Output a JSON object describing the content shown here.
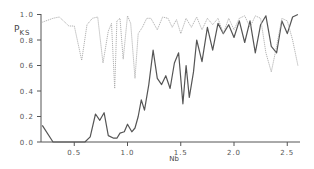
{
  "chart_data": {
    "type": "line",
    "title": "",
    "xlabel": "Nb",
    "ylabel": "P_KS",
    "ylabel_main": "P",
    "ylabel_sub": "KS",
    "xlim": [
      0.19,
      2.62
    ],
    "ylim": [
      0.0,
      1.0
    ],
    "grid": false,
    "legend": null,
    "x_ticks": [
      0.5,
      1.0,
      1.5,
      2.0,
      2.5
    ],
    "x_tick_labels": [
      "0.5",
      "1.0",
      "1.5",
      "2.0",
      "2.5"
    ],
    "y_ticks": [
      0.0,
      0.2,
      0.4,
      0.6,
      0.8,
      1.0
    ],
    "y_tick_labels": [
      "0.0",
      "0.2",
      "0.4",
      "0.6",
      "0.8",
      "1.0"
    ],
    "series": [
      {
        "name": "solid",
        "style": "solid",
        "color": "#555555",
        "x": [
          0.2,
          0.3,
          0.4,
          0.5,
          0.6,
          0.65,
          0.7,
          0.74,
          0.78,
          0.82,
          0.87,
          0.9,
          0.93,
          0.97,
          1.0,
          1.04,
          1.07,
          1.1,
          1.13,
          1.16,
          1.2,
          1.24,
          1.28,
          1.32,
          1.36,
          1.4,
          1.44,
          1.48,
          1.52,
          1.55,
          1.58,
          1.62,
          1.65,
          1.7,
          1.75,
          1.8,
          1.85,
          1.9,
          1.95,
          2.0,
          2.05,
          2.1,
          2.15,
          2.2,
          2.25,
          2.3,
          2.35,
          2.4,
          2.45,
          2.5,
          2.55,
          2.6
        ],
        "y": [
          0.13,
          0.0,
          0.0,
          0.0,
          0.0,
          0.04,
          0.22,
          0.17,
          0.23,
          0.05,
          0.03,
          0.03,
          0.07,
          0.08,
          0.14,
          0.08,
          0.11,
          0.2,
          0.33,
          0.25,
          0.45,
          0.72,
          0.5,
          0.45,
          0.52,
          0.42,
          0.62,
          0.7,
          0.3,
          0.6,
          0.35,
          0.55,
          0.8,
          0.63,
          0.9,
          0.72,
          0.93,
          0.85,
          0.92,
          0.82,
          0.95,
          0.78,
          0.95,
          0.7,
          0.92,
          0.99,
          0.75,
          0.7,
          0.95,
          0.85,
          0.98,
          1.0
        ]
      },
      {
        "name": "dotted",
        "style": "dotted",
        "color": "#aaaaaa",
        "x": [
          0.2,
          0.3,
          0.36,
          0.45,
          0.5,
          0.57,
          0.62,
          0.67,
          0.72,
          0.77,
          0.82,
          0.85,
          0.88,
          0.9,
          0.93,
          0.96,
          1.0,
          1.03,
          1.07,
          1.1,
          1.14,
          1.18,
          1.22,
          1.28,
          1.33,
          1.38,
          1.42,
          1.46,
          1.5,
          1.55,
          1.6,
          1.65,
          1.7,
          1.75,
          1.8,
          1.85,
          1.9,
          1.95,
          2.0,
          2.05,
          2.1,
          2.15,
          2.2,
          2.25,
          2.3,
          2.35,
          2.4,
          2.45,
          2.5,
          2.55,
          2.6
        ],
        "y": [
          0.94,
          0.97,
          0.98,
          0.91,
          0.91,
          0.64,
          0.92,
          0.97,
          0.98,
          0.62,
          0.87,
          0.93,
          0.42,
          0.95,
          0.97,
          0.65,
          0.99,
          0.93,
          0.5,
          0.85,
          0.9,
          0.97,
          0.97,
          0.88,
          0.98,
          0.97,
          0.9,
          0.96,
          0.85,
          0.97,
          0.9,
          0.98,
          0.88,
          0.97,
          0.92,
          0.97,
          0.85,
          0.97,
          0.88,
          0.97,
          0.99,
          0.9,
          0.99,
          0.97,
          0.7,
          0.55,
          0.75,
          0.97,
          0.95,
          0.8,
          0.6
        ]
      }
    ]
  }
}
